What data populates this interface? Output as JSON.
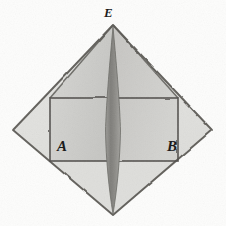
{
  "figure": {
    "kind": "geometric-line-drawing",
    "medium": "pencil-sketch-scan",
    "title": "",
    "canvas": {
      "width": 226,
      "height": 226
    },
    "background_color": "#fdfdfc",
    "ink_color": "#4a4a4a",
    "labels": [
      {
        "id": "E",
        "text": "E",
        "role": "apex-vertex",
        "x": 113,
        "y": 14
      },
      {
        "id": "A",
        "text": "A",
        "role": "left-inner-vertex",
        "x": 64,
        "y": 150
      },
      {
        "id": "B",
        "text": "B",
        "role": "right-inner-vertex",
        "x": 174,
        "y": 150
      }
    ],
    "shapes": {
      "outer_rhombus": {
        "name": "outer-rhombus",
        "points": [
          [
            113,
            25
          ],
          [
            212,
            130
          ],
          [
            113,
            215
          ],
          [
            13,
            130
          ]
        ],
        "fill": "#e2e2df",
        "stroke": "#55534f"
      },
      "upper_left_face": {
        "name": "pyramid-upper-left-face",
        "points": [
          [
            113,
            25
          ],
          [
            113,
            160
          ],
          [
            50,
            160
          ],
          [
            50,
            98
          ]
        ],
        "fill": "#cfcfcc"
      },
      "upper_right_face": {
        "name": "pyramid-upper-right-face",
        "points": [
          [
            113,
            25
          ],
          [
            178,
            98
          ],
          [
            178,
            160
          ],
          [
            113,
            160
          ]
        ],
        "fill": "#cac9c6"
      },
      "inner_rectangle": {
        "name": "inner-rectangle",
        "x": 50,
        "y": 98,
        "width": 128,
        "height": 62,
        "stroke": "#4f4d49"
      },
      "central_spindle": {
        "name": "central-spindle-lens",
        "top": [
          113,
          27
        ],
        "bottom": [
          113,
          214
        ],
        "max_half_width": 7,
        "fill": "#8d8c88"
      },
      "axis_dashed_line": {
        "name": "horizontal-axis-dashed-line",
        "y": 130,
        "x_start": 13,
        "x_end": 212,
        "dash": "10 7",
        "stroke": "#3d3b38"
      },
      "vertical_axis": {
        "name": "vertical-axis-line",
        "x": 113,
        "y_start": 25,
        "y_end": 215
      }
    }
  }
}
